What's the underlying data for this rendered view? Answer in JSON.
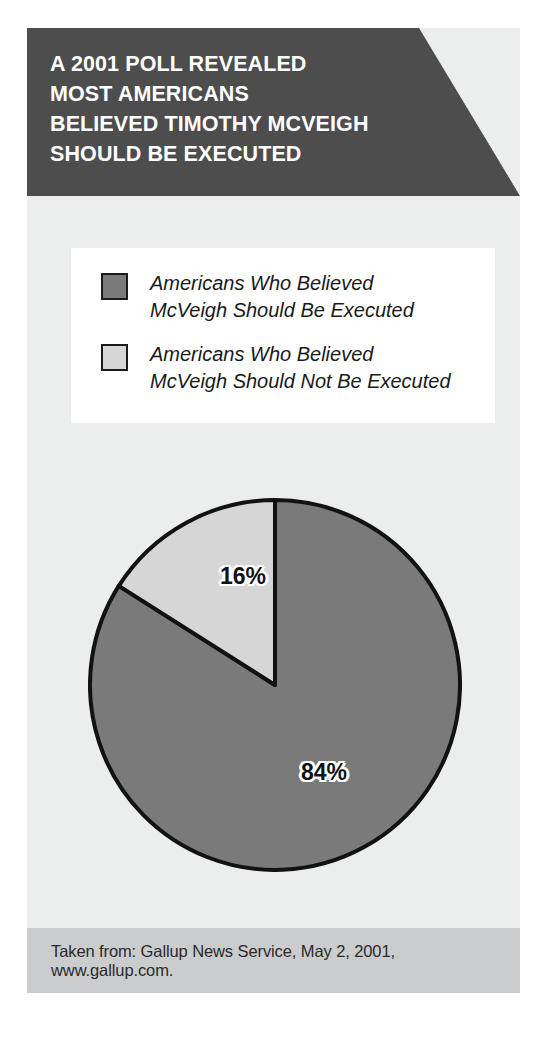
{
  "header": {
    "title": "A 2001 POLL REVEALED\nMOST AMERICANS\nBELIEVED TIMOTHY MCVEIGH\nSHOULD BE EXECUTED",
    "background_color": "#4d4d4d",
    "text_color": "#ffffff"
  },
  "legend": {
    "items": [
      {
        "label": "Americans Who Believed\nMcVeigh Should Be Executed",
        "color": "#7a7a7a"
      },
      {
        "label": "Americans Who Believed\nMcVeigh Should Not Be Executed",
        "color": "#d6d6d6"
      }
    ]
  },
  "footer": {
    "source": "Taken from: Gallup News Service, May 2, 2001, www.gallup.com."
  },
  "chart_data": {
    "type": "pie",
    "title": "A 2001 POLL REVEALED MOST AMERICANS BELIEVED TIMOTHY MCVEIGH SHOULD BE EXECUTED",
    "categories": [
      "Americans Who Believed McVeigh Should Be Executed",
      "Americans Who Believed McVeigh Should Not Be Executed"
    ],
    "values": [
      84,
      16
    ],
    "labels": [
      "84%",
      "16%"
    ],
    "colors": [
      "#7a7a7a",
      "#d6d6d6"
    ],
    "units": "percent",
    "start_angle_deg": 0,
    "direction": "clockwise",
    "legend_position": "top",
    "grid": false,
    "source": "Gallup News Service, May 2, 2001, www.gallup.com."
  }
}
